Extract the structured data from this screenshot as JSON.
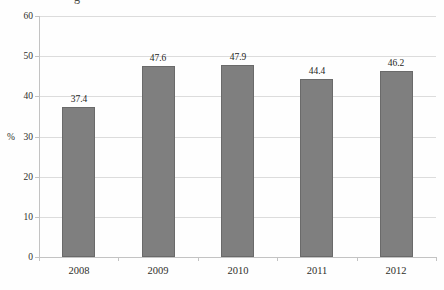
{
  "page": {
    "clipped_title_fragment": "g"
  },
  "chart_data": {
    "type": "bar",
    "title": "",
    "categories": [
      "2008",
      "2009",
      "2010",
      "2011",
      "2012"
    ],
    "values": [
      37.4,
      47.6,
      47.9,
      44.4,
      46.2
    ],
    "value_labels": [
      "37.4",
      "47.6",
      "47.9",
      "44.4",
      "46.2"
    ],
    "xlabel": "",
    "ylabel": "%",
    "ylim": [
      0,
      60
    ],
    "yticks": [
      0,
      10,
      20,
      30,
      40,
      50,
      60
    ],
    "grid": "horizontal",
    "legend": "none",
    "colors": {
      "bar_fill": "#7f7f7f",
      "bar_border": "#6a6a6a",
      "gridline": "#dcdcdc",
      "axis_line": "#c3c3c3",
      "tick_label": "#2e2e2a",
      "value_label": "#1f1f1c"
    }
  }
}
